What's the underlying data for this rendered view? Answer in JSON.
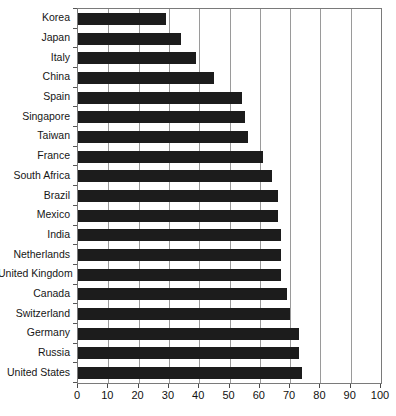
{
  "chart": {
    "title": "",
    "title_visible_fragment": "",
    "note": "bar chart, horizontal bars, title cropped at top edge"
  },
  "chart_data": {
    "type": "bar",
    "orientation": "horizontal",
    "title": "",
    "xlabel": "",
    "ylabel": "",
    "xlim": [
      0,
      100
    ],
    "xticks": [
      0,
      10,
      20,
      30,
      40,
      50,
      60,
      70,
      80,
      90,
      100
    ],
    "grid": true,
    "grid_axis": "x",
    "legend": false,
    "bar_color": "#1c1c1c",
    "categories": [
      "Korea",
      "Japan",
      "Italy",
      "China",
      "Spain",
      "Singapore",
      "Taiwan",
      "France",
      "South Africa",
      "Brazil",
      "Mexico",
      "India",
      "Netherlands",
      "United Kingdom",
      "Canada",
      "Switzerland",
      "Germany",
      "Russia",
      "United States"
    ],
    "values": [
      29,
      34,
      39,
      45,
      54,
      55,
      56,
      61,
      64,
      66,
      66,
      67,
      67,
      67,
      69,
      70,
      73,
      73,
      74
    ]
  }
}
